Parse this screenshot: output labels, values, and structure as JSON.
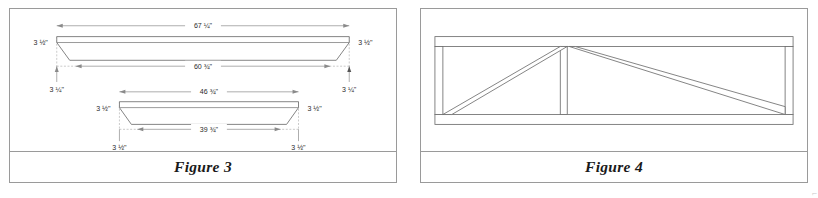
{
  "figures": [
    {
      "id": "figure-3",
      "caption": "Figure 3",
      "description": "Two beveled board blanks shown in elevation with length and bevel dimensions",
      "parts": [
        {
          "name": "upper-board",
          "top_length": "67 ¼\"",
          "bottom_length": "60 ¾\"",
          "left_height": "3 ½\"",
          "right_height": "3 ½\"",
          "left_bevel_run": "3 ¼\"",
          "right_bevel_run": "3 ¼\""
        },
        {
          "name": "lower-board",
          "top_length": "46 ¾\"",
          "bottom_length": "39 ¾\"",
          "left_height": "3 ½\"",
          "right_height": "3 ½\"",
          "left_bevel_run": "3 ½\"",
          "right_bevel_run": "3 ½\""
        }
      ]
    },
    {
      "id": "figure-4",
      "caption": "Figure 4",
      "description": "Assembled rectangular truss frame with center post and two diagonal braces",
      "members": [
        "top-rail",
        "bottom-rail",
        "left-post",
        "right-post",
        "center-post",
        "left-diagonal-brace",
        "right-diagonal-brace"
      ]
    }
  ],
  "colors": {
    "panel_border": "#9a9a9a",
    "line": "#6e6e6e",
    "dim_line": "#8a8a8a",
    "text": "#2b2b2b",
    "background": "#ffffff"
  },
  "corner_mark": "⌐"
}
